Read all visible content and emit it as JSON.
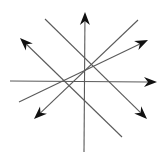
{
  "diagram": {
    "title": "",
    "width": 164,
    "height": 161,
    "background": "#ffffff",
    "line_color": "#5a5a5a",
    "arrow_color": "#111111",
    "line_width": 1.1,
    "lines": [
      {
        "id": "vertical-up",
        "from": [
          84,
          152
        ],
        "to": [
          85,
          12
        ],
        "arrow": true
      },
      {
        "id": "horizontal-right",
        "from": [
          10,
          81
        ],
        "to": [
          157,
          82
        ],
        "arrow": true
      },
      {
        "id": "diag-down-right",
        "from": [
          45,
          19
        ],
        "to": [
          147,
          119
        ],
        "arrow": true
      },
      {
        "id": "diag-down-left",
        "from": [
          138,
          20
        ],
        "to": [
          34,
          119
        ],
        "arrow": true
      },
      {
        "id": "diag-up-left",
        "from": [
          122,
          137
        ],
        "to": [
          20,
          38
        ],
        "arrow": true
      },
      {
        "id": "shallow-up-right",
        "from": [
          19,
          102
        ],
        "to": [
          148,
          40
        ],
        "arrow": true
      }
    ]
  }
}
